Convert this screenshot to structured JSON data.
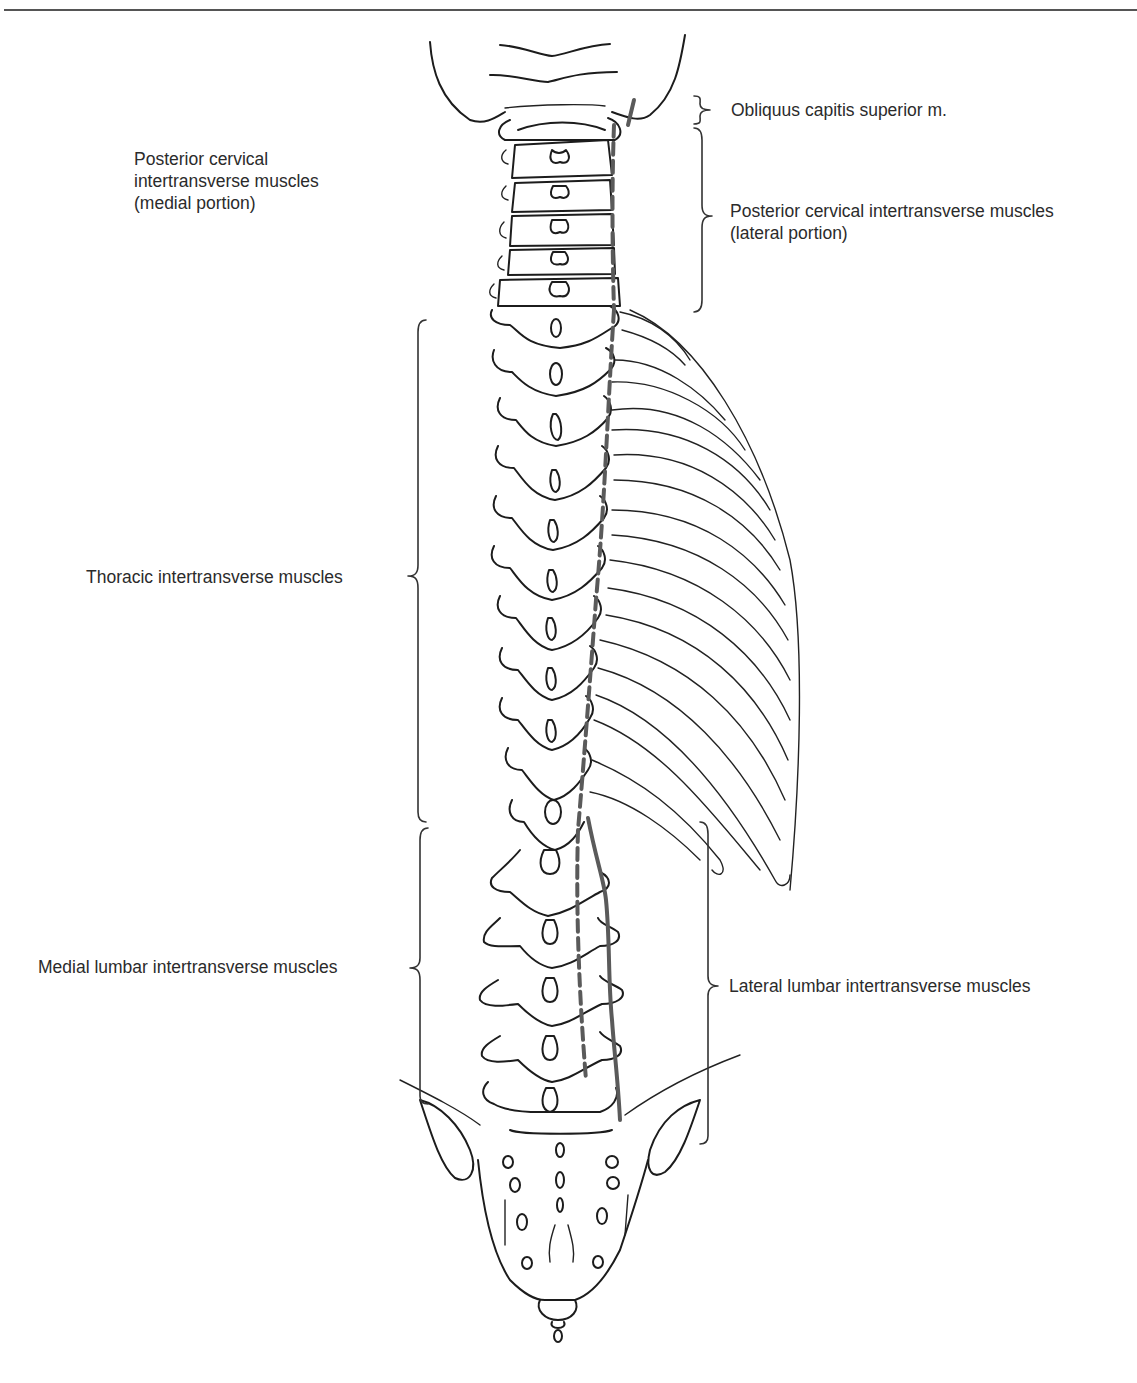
{
  "figure": {
    "labels": {
      "obliquus": {
        "text": "Obliquus capitis superior m."
      },
      "post_cervical_medial": {
        "lines": [
          "Posterior cervical",
          "intertransverse muscles",
          "(medial portion)"
        ]
      },
      "post_cervical_lateral": {
        "lines": [
          "Posterior cervical intertransverse muscles",
          "(lateral portion)"
        ]
      },
      "thoracic": {
        "text": "Thoracic intertransverse muscles"
      },
      "medial_lumbar": {
        "text": "Medial lumbar intertransverse muscles"
      },
      "lateral_lumbar": {
        "text": "Lateral lumbar intertransverse muscles"
      }
    },
    "colors": {
      "line": "#1c1c1c",
      "muscle": "#5a5a5a",
      "text": "#2b2b2b",
      "background": "#ffffff"
    }
  }
}
